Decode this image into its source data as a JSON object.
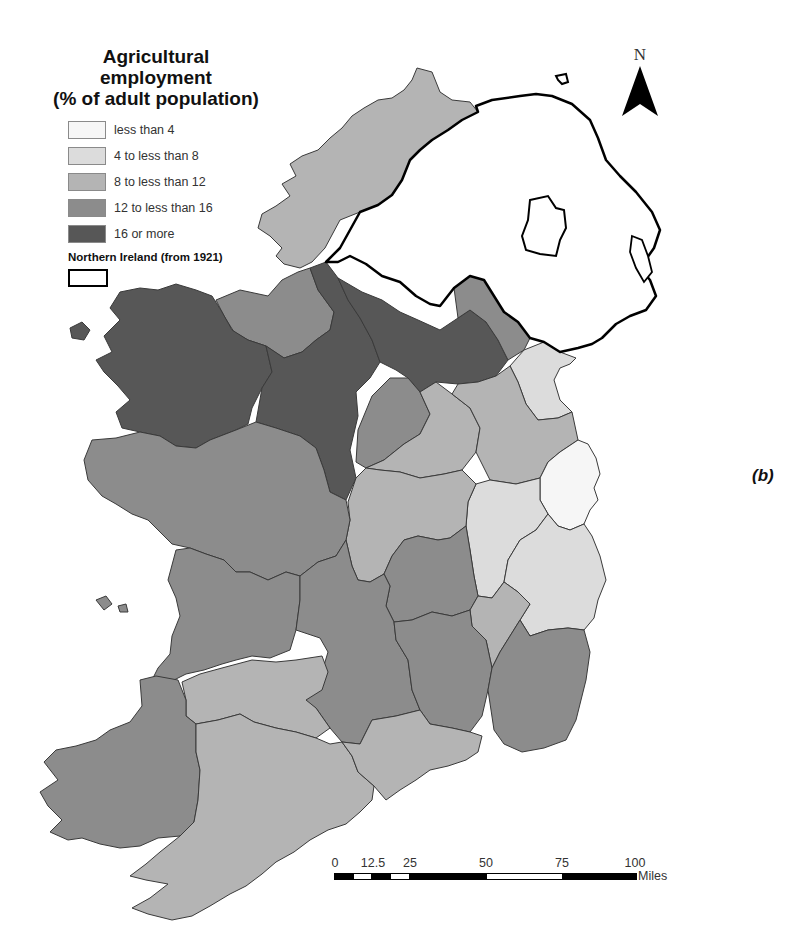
{
  "legend": {
    "title_line1": "Agricultural employment",
    "title_line2": "(% of adult population)",
    "classes": [
      {
        "label": "less than 4",
        "color": "#f6f6f6"
      },
      {
        "label": "4 to less than 8",
        "color": "#dcdcdc"
      },
      {
        "label": "8 to less than 12",
        "color": "#b4b4b4"
      },
      {
        "label": "12 to less than 16",
        "color": "#8c8c8c"
      },
      {
        "label": "16 or more",
        "color": "#575757"
      }
    ],
    "ni_label": "Northern Ireland (from 1921)"
  },
  "north_arrow": {
    "label": "N"
  },
  "panel_label": "(b)",
  "scale_bar": {
    "ticks": [
      "0",
      "12.5",
      "25",
      "50",
      "75",
      "100"
    ],
    "unit": "Miles"
  },
  "colors": {
    "outline": "#3a3a3a",
    "ni_border": "#000000",
    "background": "#ffffff"
  }
}
